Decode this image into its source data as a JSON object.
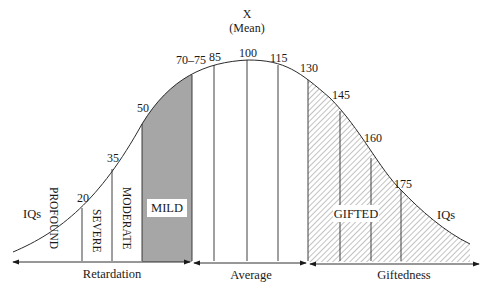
{
  "title": {
    "mean_symbol": "X",
    "mean_label": "(Mean)"
  },
  "iq_labels": {
    "left": "IQs",
    "right": "IQs"
  },
  "tick_values": [
    {
      "label": "20",
      "x": 82
    },
    {
      "label": "35",
      "x": 112
    },
    {
      "label": "50",
      "x": 142
    },
    {
      "label": "70–75",
      "x": 192
    },
    {
      "label": "85",
      "x": 214
    },
    {
      "label": "100",
      "x": 247
    },
    {
      "label": "115",
      "x": 278
    },
    {
      "label": "130",
      "x": 308
    },
    {
      "label": "145",
      "x": 340
    },
    {
      "label": "160",
      "x": 371
    },
    {
      "label": "175",
      "x": 401
    }
  ],
  "categories": {
    "profound": "PROFOUND",
    "severe": "SEVERE",
    "moderate": "MODERATE",
    "mild": "MILD",
    "gifted": "GIFTED"
  },
  "ranges": {
    "retardation": "Retardation",
    "average": "Average",
    "giftedness": "Giftedness"
  },
  "colors": {
    "mild_fill": "#a6a6a6",
    "line": "#2a2a2a",
    "hatch": "#555555"
  }
}
